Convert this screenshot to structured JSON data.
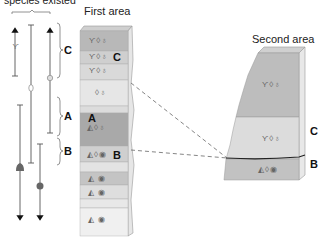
{
  "header": {
    "left_title": "species existed",
    "first_area_title": "First area",
    "second_area_title": "Second area"
  },
  "range_chart": {
    "bracket_labels": [
      "C",
      "A",
      "B"
    ],
    "species": [
      {
        "name": "trilobite-like",
        "range": "C only",
        "extends_up": true
      },
      {
        "name": "oval-shell",
        "range": "C through B"
      },
      {
        "name": "ammonite-like",
        "range": "C through A",
        "extends_up": true
      },
      {
        "name": "gastropod",
        "range": "A downward",
        "extends_down": true
      },
      {
        "name": "coiled-shell",
        "range": "B downward",
        "extends_down": true
      }
    ]
  },
  "first_area": {
    "layers": [
      {
        "fossils": "ϒ◊♁",
        "label": "",
        "shade": "#b8b8b8"
      },
      {
        "fossils": "ϒ◊♁",
        "label": "C",
        "shade": "#cfcfcf"
      },
      {
        "fossils": "ϒ◊♁",
        "label": "",
        "shade": "#d9d9d9"
      },
      {
        "fossils": "◊♁",
        "label": "",
        "shade": "#e6e6e6"
      },
      {
        "fossils": "",
        "label": "",
        "shade": "#dcdcdc"
      },
      {
        "fossils": "◭◊♁",
        "label": "A",
        "shade": "#a9a9a9"
      },
      {
        "fossils": "◭◊◉",
        "label": "B",
        "shade": "#cfcfcf"
      },
      {
        "fossils": "",
        "label": "",
        "shade": "#e3e3e3"
      },
      {
        "fossils": "◭ ◉",
        "label": "",
        "shade": "#c4c4c4"
      },
      {
        "fossils": "◭ ◉",
        "label": "",
        "shade": "#dedede"
      },
      {
        "fossils": "",
        "label": "",
        "shade": "#e8e8e8"
      },
      {
        "fossils": "◭ ◉",
        "label": "",
        "shade": "#eeeeee"
      }
    ]
  },
  "second_area": {
    "layers": [
      {
        "fossils": "ϒ◊♁",
        "label": "",
        "shade": "#bdbdbd"
      },
      {
        "fossils": "ϒ◊♁",
        "label": "C",
        "shade": "#dcdcdc"
      },
      {
        "fossils": "◭◊◉",
        "label": "B",
        "shade": "#c2c2c2"
      }
    ]
  },
  "colors": {
    "line": "#555555",
    "dash": "#666666",
    "side_face": "#e4e4e4",
    "top_face": "#d0d0d0"
  }
}
